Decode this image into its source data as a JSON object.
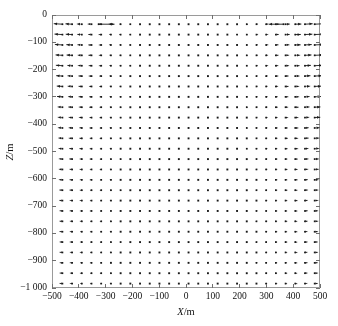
{
  "figure": {
    "title": "",
    "background_color": "#ffffff",
    "frame_color": "#9a9a9a",
    "marker_color": "#1a1a1a"
  },
  "axes": {
    "x": {
      "label_prefix": "X",
      "label_suffix": "/m",
      "label_full": "X/m",
      "min": -500,
      "max": 500,
      "step": 100,
      "ticks": [
        -500,
        -400,
        -300,
        -200,
        -100,
        0,
        100,
        200,
        300,
        400,
        500
      ],
      "tick_labels": [
        "−500",
        "−400",
        "−300",
        "−200",
        "−100",
        "0",
        "100",
        "200",
        "300",
        "400",
        "500"
      ]
    },
    "y": {
      "label_prefix": "Z",
      "label_suffix": "/m",
      "label_full": "Z/m",
      "min": -1000,
      "max": 0,
      "step": 100,
      "ticks": [
        0,
        -100,
        -200,
        -300,
        -400,
        -500,
        -600,
        -700,
        -800,
        -900,
        -1000
      ],
      "tick_labels": [
        "0",
        "−100",
        "−200",
        "−300",
        "−400",
        "−500",
        "−600",
        "−700",
        "−800",
        "−900",
        "−1 000"
      ]
    }
  },
  "chart_data": {
    "type": "scatter",
    "subtype": "quiver",
    "title": "",
    "xlabel": "X/m",
    "ylabel": "Z/m",
    "xlim": [
      -500,
      500
    ],
    "ylim": [
      -1000,
      0
    ],
    "grid": false,
    "legend": null,
    "annotations": [
      {
        "name": "outward-arrow-top-left",
        "x": -330,
        "z": -30,
        "u": 60,
        "v": 0,
        "direction": "right",
        "note": "largest arrow, points outward to the right near top-left"
      },
      {
        "name": "inward-arrow-top-right",
        "x": 360,
        "z": -30,
        "u": -55,
        "v": 0,
        "direction": "left",
        "note": "large arrow, points inward to the left near top-right"
      }
    ],
    "grid_spec": {
      "nx": 27,
      "nz": 26,
      "x_start": -465,
      "x_end": 475,
      "x_spacing": 36.2,
      "z_start": -30,
      "z_end": -980,
      "z_spacing": 38.0
    },
    "marker_description": "each grid node draws a small arrow; magnitudes are near zero over most of the domain so nodes render as dots, growing slightly toward the left and right margins and strongly at two top-corner sites",
    "field_model": {
      "base_magnitude": 0.18,
      "edge_gain_left": 1.9,
      "edge_gain_right": 2.1,
      "top_gain": 1.35,
      "description": "horizontal dilation field: vectors point outward from the vertical centerline, amplitude grows toward the lateral boundaries and toward the free surface"
    }
  }
}
